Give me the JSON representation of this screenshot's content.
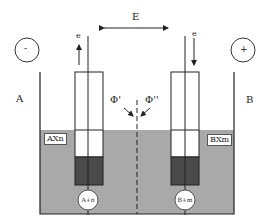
{
  "diagram": {
    "field_label": "E",
    "left_electrode_label": "A",
    "right_electrode_label": "B",
    "left_terminal_sign": "-",
    "right_terminal_sign": "+",
    "electron_label_left": "e",
    "electron_label_right": "e",
    "phi_left": "Φ'",
    "phi_right": "Φ''",
    "left_solution": "AXn",
    "right_solution": "BXm",
    "left_ion": "A+n",
    "right_ion": "B+m",
    "colors": {
      "solution": "#a9a9a9",
      "electrode_dark": "#4a4a4a",
      "line": "#222222"
    }
  }
}
